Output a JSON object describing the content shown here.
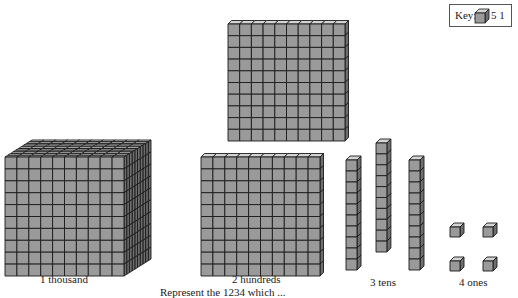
{
  "key": {
    "label": "Key:",
    "icon": "unit-cube-icon",
    "value": "5 1"
  },
  "blocks": [
    {
      "name": "thousand-cube",
      "label": "1 thousand",
      "count": 1,
      "place_value": 1000
    },
    {
      "name": "hundred-flats",
      "label": "2 hundreds",
      "count": 2,
      "place_value": 100
    },
    {
      "name": "ten-rods",
      "label": "3 tens",
      "count": 3,
      "place_value": 10
    },
    {
      "name": "one-cubes",
      "label": "4 ones",
      "count": 4,
      "place_value": 1
    }
  ],
  "caption": "Represent the 1234 which ...",
  "colors": {
    "front": "#9a9a9a",
    "top": "#d4d4d4",
    "side": "#6e6e6e",
    "line": "#1a1a1a"
  }
}
